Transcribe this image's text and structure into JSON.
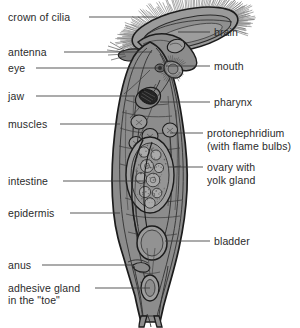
{
  "diagram": {
    "background_color": "#ffffff",
    "body_fill": "#8c8c8c",
    "body_fill_light": "#a8a8a8",
    "body_fill_dark": "#767676",
    "outline_color": "#1c1c1c",
    "text_color": "#2b2b2b",
    "leader_color": "#3a3a3a"
  },
  "labels_left": [
    {
      "id": "crown-of-cilia",
      "text": "crown of cilia",
      "x": 8,
      "y": 11,
      "leader_x1": 89,
      "leader_x2": 157,
      "leader_y": 17
    },
    {
      "id": "antenna",
      "text": "antenna",
      "x": 8,
      "y": 46,
      "leader_x1": 64,
      "leader_x2": 152,
      "leader_y": 52
    },
    {
      "id": "eye",
      "text": "eye",
      "x": 8,
      "y": 62,
      "leader_x1": 36,
      "leader_x2": 160,
      "leader_y": 68
    },
    {
      "id": "jaw",
      "text": "jaw",
      "x": 8,
      "y": 90,
      "leader_x1": 36,
      "leader_x2": 135,
      "leader_y": 96
    },
    {
      "id": "muscles",
      "text": "muscles",
      "x": 8,
      "y": 118,
      "leader_x1": 60,
      "leader_x2": 120,
      "leader_y": 124
    },
    {
      "id": "intestine",
      "text": "intestine",
      "x": 8,
      "y": 175,
      "leader_x1": 63,
      "leader_x2": 143,
      "leader_y": 181
    },
    {
      "id": "epidermis",
      "text": "epidermis",
      "x": 8,
      "y": 207,
      "leader_x1": 70,
      "leader_x2": 120,
      "leader_y": 213
    },
    {
      "id": "anus",
      "text": "anus",
      "x": 8,
      "y": 259,
      "leader_x1": 42,
      "leader_x2": 133,
      "leader_y": 265
    },
    {
      "id": "adhesive-gland",
      "text": "adhesive gland",
      "x": 8,
      "y": 282,
      "leader_x1": 95,
      "leader_x2": 150,
      "leader_y": 288
    },
    {
      "id": "in-the-toe",
      "text": "in the \"toe\"",
      "x": 8,
      "y": 294,
      "leader_x1": null,
      "leader_x2": null,
      "leader_y": null
    }
  ],
  "labels_right": [
    {
      "id": "brain",
      "text": "brain",
      "x": 214,
      "y": 26,
      "leader_x1": 178,
      "leader_x2": 210,
      "leader_y": 32
    },
    {
      "id": "mouth",
      "text": "mouth",
      "x": 214,
      "y": 60,
      "leader_x1": 166,
      "leader_x2": 210,
      "leader_y": 66
    },
    {
      "id": "pharynx",
      "text": "pharynx",
      "x": 214,
      "y": 96,
      "leader_x1": 160,
      "leader_x2": 210,
      "leader_y": 102
    },
    {
      "id": "protonephridium",
      "text": "protonephridium",
      "x": 207,
      "y": 127,
      "leader_x1": 170,
      "leader_x2": 203,
      "leader_y": 133
    },
    {
      "id": "with-flame-bulbs",
      "text": "(with flame bulbs)",
      "x": 207,
      "y": 140,
      "leader_x1": null,
      "leader_x2": null,
      "leader_y": null
    },
    {
      "id": "ovary-with",
      "text": "ovary with",
      "x": 207,
      "y": 161,
      "leader_x1": 168,
      "leader_x2": 203,
      "leader_y": 167
    },
    {
      "id": "yolk-gland",
      "text": "yolk gland",
      "x": 207,
      "y": 174,
      "leader_x1": null,
      "leader_x2": null,
      "leader_y": null
    },
    {
      "id": "bladder",
      "text": "bladder",
      "x": 214,
      "y": 235,
      "leader_x1": 165,
      "leader_x2": 210,
      "leader_y": 241
    }
  ]
}
